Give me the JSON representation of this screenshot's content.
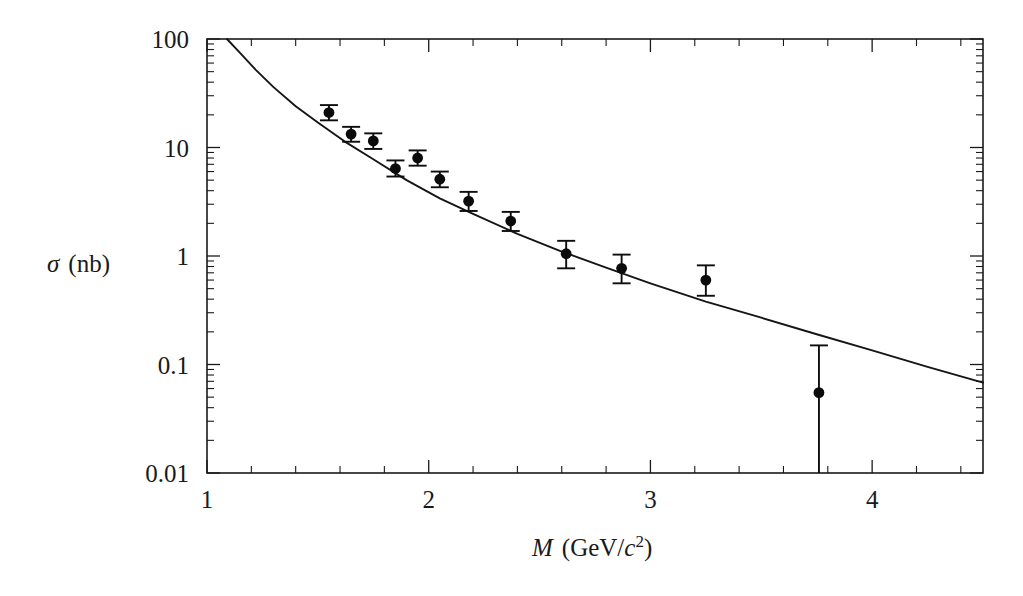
{
  "figure": {
    "background_color": "#ffffff",
    "ink_color": "#111111"
  },
  "chart_data": {
    "type": "scatter",
    "title": "",
    "subtitle": "",
    "xlabel": "M (GeV/c2)",
    "xlabel_parts": {
      "symbol": "M",
      "unit_open": "(GeV/",
      "unit_italic": "c",
      "unit_sup": "2",
      "unit_close": ")"
    },
    "ylabel": "σ (nb)",
    "ylabel_parts": {
      "symbol": "σ",
      "unit": "(nb)"
    },
    "xscale": "linear",
    "yscale": "log",
    "xlim": [
      1.0,
      4.5
    ],
    "ylim": [
      0.01,
      100
    ],
    "grid": false,
    "legend": "none",
    "xticks": [
      1,
      2,
      3,
      4
    ],
    "xtick_labels": [
      "1",
      "2",
      "3",
      "4"
    ],
    "xminor_step": 0.2,
    "yticks": [
      0.01,
      0.1,
      1,
      10,
      100
    ],
    "ytick_labels": [
      "0.01",
      "0.1",
      "1",
      "10",
      "100"
    ],
    "yminor": "log-decade-2-to-9",
    "series": [
      {
        "name": "measurement",
        "kind": "points-with-errorbars",
        "marker": "filled-circle",
        "points": [
          {
            "x": 1.55,
            "y": 21.0,
            "yerr_low": 3.2,
            "yerr_high": 3.6
          },
          {
            "x": 1.65,
            "y": 13.3,
            "yerr_low": 2.0,
            "yerr_high": 2.2
          },
          {
            "x": 1.75,
            "y": 11.5,
            "yerr_low": 1.8,
            "yerr_high": 2.0
          },
          {
            "x": 1.85,
            "y": 6.4,
            "yerr_low": 1.0,
            "yerr_high": 1.2
          },
          {
            "x": 1.95,
            "y": 8.0,
            "yerr_low": 1.2,
            "yerr_high": 1.4
          },
          {
            "x": 2.05,
            "y": 5.1,
            "yerr_low": 0.8,
            "yerr_high": 0.9
          },
          {
            "x": 2.18,
            "y": 3.2,
            "yerr_low": 0.6,
            "yerr_high": 0.7
          },
          {
            "x": 2.37,
            "y": 2.1,
            "yerr_low": 0.4,
            "yerr_high": 0.45
          },
          {
            "x": 2.62,
            "y": 1.05,
            "yerr_low": 0.28,
            "yerr_high": 0.33
          },
          {
            "x": 2.87,
            "y": 0.77,
            "yerr_low": 0.21,
            "yerr_high": 0.26
          },
          {
            "x": 3.25,
            "y": 0.6,
            "yerr_low": 0.17,
            "yerr_high": 0.22
          },
          {
            "x": 3.76,
            "y": 0.055,
            "yerr_low": 0.045,
            "yerr_high": 0.095
          }
        ]
      },
      {
        "name": "model-prediction",
        "kind": "line",
        "x": [
          1.09,
          1.15,
          1.22,
          1.3,
          1.4,
          1.5,
          1.62,
          1.75,
          1.9,
          2.05,
          2.2,
          2.4,
          2.6,
          2.8,
          3.0,
          3.25,
          3.5,
          3.75,
          4.0,
          4.25,
          4.5
        ],
        "y": [
          100,
          74,
          52,
          36,
          24,
          17,
          11.4,
          7.8,
          5.0,
          3.4,
          2.45,
          1.6,
          1.1,
          0.78,
          0.56,
          0.38,
          0.27,
          0.19,
          0.135,
          0.095,
          0.068
        ]
      }
    ]
  }
}
